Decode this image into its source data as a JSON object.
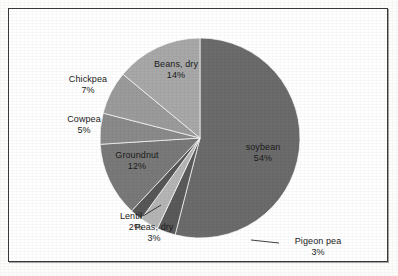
{
  "chart_data": {
    "type": "pie",
    "title": "",
    "subtitle": "",
    "xlabel": "",
    "ylabel": "",
    "legend_position": "none",
    "grid": false,
    "units": "percent",
    "start_angle_deg": 0,
    "direction": "clockwise",
    "categories": [
      "soybean",
      "Pigeon pea",
      "Peas, dry",
      "Lentil",
      "Groundnut",
      "Cowpea",
      "Chickpea",
      "Beans, dry"
    ],
    "values": [
      54,
      3,
      3,
      2,
      12,
      5,
      7,
      14
    ],
    "slices": [
      {
        "name": "soybean",
        "value": 54,
        "value_label": "54%",
        "color": "#6b6b6b",
        "label_placement": "inside",
        "leader_line": false
      },
      {
        "name": "Pigeon pea",
        "value": 3,
        "value_label": "3%",
        "color": "#5a5a5a",
        "label_placement": "outside",
        "leader_line": true
      },
      {
        "name": "Peas, dry",
        "value": 3,
        "value_label": "3%",
        "color": "#b5b5b5",
        "label_placement": "outside",
        "leader_line": false
      },
      {
        "name": "Lentil",
        "value": 2,
        "value_label": "2%",
        "color": "#575757",
        "label_placement": "outside",
        "leader_line": true
      },
      {
        "name": "Groundnut",
        "value": 12,
        "value_label": "12%",
        "color": "#797979",
        "label_placement": "inside",
        "leader_line": false
      },
      {
        "name": "Cowpea",
        "value": 5,
        "value_label": "5%",
        "color": "#8a8a8a",
        "label_placement": "outside",
        "leader_line": false
      },
      {
        "name": "Chickpea",
        "value": 7,
        "value_label": "7%",
        "color": "#9b9b9b",
        "label_placement": "outside",
        "leader_line": false
      },
      {
        "name": "Beans, dry",
        "value": 14,
        "value_label": "14%",
        "color": "#a8a8a8",
        "label_placement": "inside",
        "leader_line": false
      }
    ]
  },
  "figure": {
    "border_color": "#3a3a3a",
    "background_color": "#ffffff",
    "label_text_color": "#1b1b1b"
  }
}
